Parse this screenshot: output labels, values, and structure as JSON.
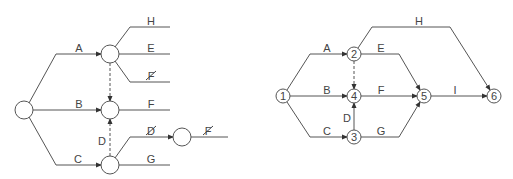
{
  "left_diagram": {
    "labels": {
      "A": "A",
      "B": "B",
      "C": "C",
      "D": "D",
      "H": "H",
      "E": "E",
      "F_struck": "F",
      "F": "F",
      "D_struck": "D",
      "F_struck2": "F",
      "G": "G"
    }
  },
  "right_diagram": {
    "nodes": [
      "1",
      "2",
      "3",
      "4",
      "5",
      "6"
    ],
    "labels": {
      "A": "A",
      "B": "B",
      "C": "C",
      "D": "D",
      "E": "E",
      "F": "F",
      "G": "G",
      "H": "H",
      "I": "I"
    }
  }
}
